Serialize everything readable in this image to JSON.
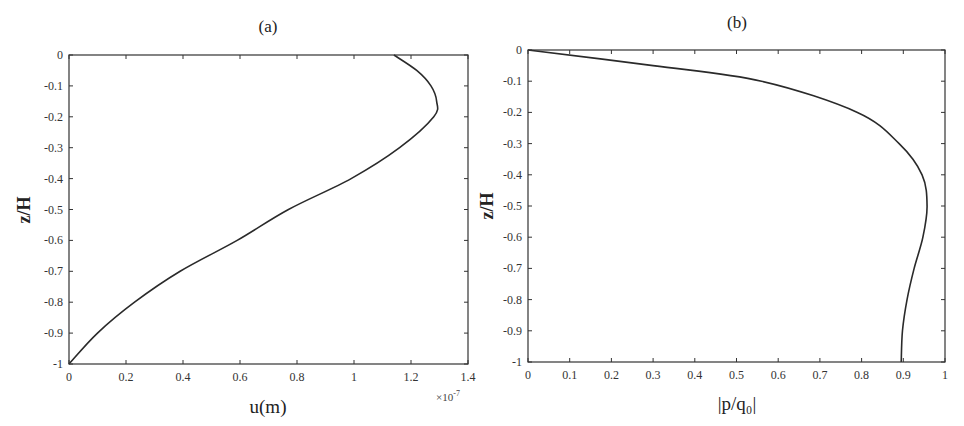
{
  "chart_data": [
    {
      "type": "line",
      "panel": "a",
      "title": "(a)",
      "xlabel": "u(m)",
      "ylabel": "z/H",
      "x_multiplier": "×10^-7",
      "x_multiplier_text": "×10",
      "x_multiplier_exp": "-7",
      "xlim": [
        0,
        1.4
      ],
      "ylim": [
        -1,
        0
      ],
      "xticks": [
        "0",
        "0.2",
        "0.4",
        "0.6",
        "0.8",
        "1",
        "1.2",
        "1.4"
      ],
      "yticks": [
        "0",
        "-0.1",
        "-0.2",
        "-0.3",
        "-0.4",
        "-0.5",
        "-0.6",
        "-0.7",
        "-0.8",
        "-0.9",
        "-1"
      ],
      "grid": false,
      "legend": null,
      "series": [
        {
          "name": "u",
          "x": [
            1.14,
            1.22,
            1.27,
            1.29,
            1.28,
            1.16,
            0.99,
            0.77,
            0.59,
            0.39,
            0.23,
            0.1,
            0.0
          ],
          "y": [
            0,
            -0.05,
            -0.1,
            -0.15,
            -0.2,
            -0.3,
            -0.4,
            -0.5,
            -0.6,
            -0.7,
            -0.8,
            -0.9,
            -1.0
          ]
        }
      ]
    },
    {
      "type": "line",
      "panel": "b",
      "title": "(b)",
      "xlabel": "|p/q₀|",
      "ylabel": "z/H",
      "xlim": [
        0,
        1
      ],
      "ylim": [
        -1,
        0
      ],
      "xticks": [
        "0",
        "0.1",
        "0.2",
        "0.3",
        "0.4",
        "0.5",
        "0.6",
        "0.7",
        "0.8",
        "0.9",
        "1"
      ],
      "yticks": [
        "0",
        "-0.1",
        "-0.2",
        "-0.3",
        "-0.4",
        "-0.5",
        "-0.6",
        "-0.7",
        "-0.8",
        "-0.9",
        "-1"
      ],
      "grid": false,
      "legend": null,
      "series": [
        {
          "name": "|p/q0|",
          "x": [
            0.0,
            0.3,
            0.56,
            0.79,
            0.89,
            0.945,
            0.957,
            0.947,
            0.926,
            0.909,
            0.898,
            0.895
          ],
          "y": [
            0,
            -0.05,
            -0.1,
            -0.2,
            -0.3,
            -0.4,
            -0.5,
            -0.6,
            -0.7,
            -0.8,
            -0.9,
            -1.0
          ]
        }
      ]
    }
  ]
}
